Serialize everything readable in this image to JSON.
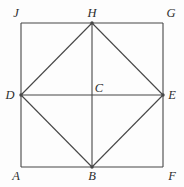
{
  "figure": {
    "canvas": {
      "width": 184,
      "height": 187,
      "background": "#fdfdfd"
    },
    "stroke_color": "#474747",
    "label_color": "#2e2e2e",
    "stroke_width": 1.1,
    "dot_radius": 1.7,
    "points": {
      "J": {
        "x": 21,
        "y": 23
      },
      "G": {
        "x": 163,
        "y": 23
      },
      "F": {
        "x": 163,
        "y": 167
      },
      "A": {
        "x": 21,
        "y": 167
      },
      "H": {
        "x": 92,
        "y": 23
      },
      "E": {
        "x": 163,
        "y": 95
      },
      "B": {
        "x": 92,
        "y": 167
      },
      "D": {
        "x": 21,
        "y": 95
      },
      "C": {
        "x": 92,
        "y": 95
      }
    },
    "segments": [
      {
        "from": "J",
        "to": "G"
      },
      {
        "from": "G",
        "to": "F"
      },
      {
        "from": "F",
        "to": "A"
      },
      {
        "from": "A",
        "to": "J"
      },
      {
        "from": "D",
        "to": "H"
      },
      {
        "from": "H",
        "to": "E"
      },
      {
        "from": "E",
        "to": "B"
      },
      {
        "from": "B",
        "to": "D"
      },
      {
        "from": "D",
        "to": "E"
      },
      {
        "from": "H",
        "to": "B"
      }
    ],
    "dots": [
      "D",
      "H",
      "E",
      "B"
    ],
    "labels": [
      {
        "text": "J",
        "x": 16,
        "y": 17
      },
      {
        "text": "H",
        "x": 92,
        "y": 17
      },
      {
        "text": "G",
        "x": 171,
        "y": 17
      },
      {
        "text": "D",
        "x": 10,
        "y": 99
      },
      {
        "text": "C",
        "x": 99,
        "y": 92
      },
      {
        "text": "E",
        "x": 172,
        "y": 99
      },
      {
        "text": "A",
        "x": 16,
        "y": 180
      },
      {
        "text": "B",
        "x": 92,
        "y": 180
      },
      {
        "text": "F",
        "x": 172,
        "y": 180
      }
    ]
  }
}
